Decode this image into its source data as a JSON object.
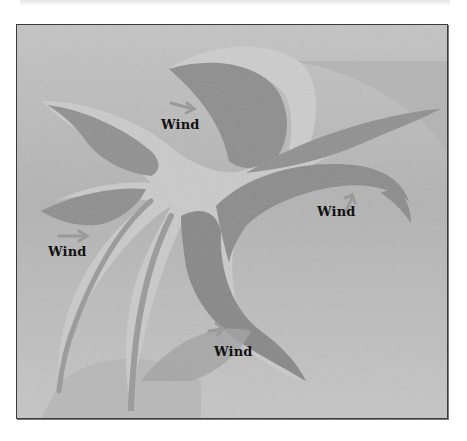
{
  "figure": {
    "colors": {
      "background": "#bfbfbf",
      "dark_fill": "#8c8c8c",
      "light_band": "#cbcbcb",
      "frame": "#3a3a3a",
      "label_text": "#111111"
    },
    "labels": [
      {
        "text": "Wind",
        "x": 160,
        "y": 120
      },
      {
        "text": "Wind",
        "x": 47,
        "y": 246
      },
      {
        "text": "Wind",
        "x": 316,
        "y": 206
      },
      {
        "text": "Wind",
        "x": 213,
        "y": 346
      }
    ]
  }
}
